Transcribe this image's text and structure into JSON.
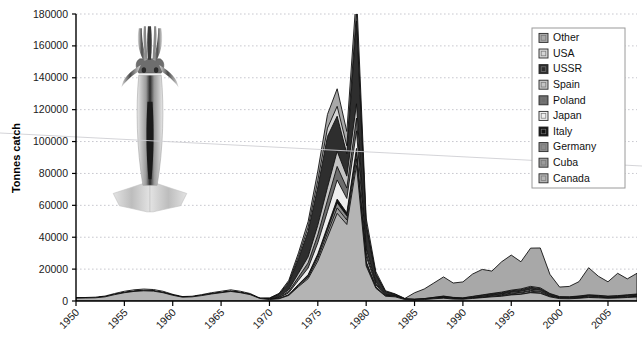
{
  "chart_data": {
    "type": "area",
    "title": "",
    "subtitle": "",
    "xlabel": "",
    "ylabel": "Tonnes catch",
    "stacked": true,
    "grid": true,
    "legend_position": "right-top",
    "xlim": [
      1950,
      2008
    ],
    "ylim": [
      0,
      180000
    ],
    "ytick_labels": [
      "0",
      "20000",
      "40000",
      "60000",
      "80000",
      "100000",
      "120000",
      "140000",
      "160000",
      "180000"
    ],
    "ytick_values": [
      0,
      20000,
      40000,
      60000,
      80000,
      100000,
      120000,
      140000,
      160000,
      180000
    ],
    "xtick_labels": [
      "1950",
      "1955",
      "1960",
      "1965",
      "1970",
      "1975",
      "1980",
      "1985",
      "1990",
      "1995",
      "2000",
      "2005"
    ],
    "xtick_values": [
      1950,
      1955,
      1960,
      1965,
      1970,
      1975,
      1980,
      1985,
      1990,
      1995,
      2000,
      2005
    ],
    "x": [
      1950,
      1951,
      1952,
      1953,
      1954,
      1955,
      1956,
      1957,
      1958,
      1959,
      1960,
      1961,
      1962,
      1963,
      1964,
      1965,
      1966,
      1967,
      1968,
      1969,
      1970,
      1971,
      1972,
      1973,
      1974,
      1975,
      1976,
      1977,
      1978,
      1979,
      1980,
      1981,
      1982,
      1983,
      1984,
      1985,
      1986,
      1987,
      1988,
      1989,
      1990,
      1991,
      1992,
      1993,
      1994,
      1995,
      1996,
      1997,
      1998,
      1999,
      2000,
      2001,
      2002,
      2003,
      2004,
      2005,
      2006,
      2007,
      2008
    ],
    "series": [
      {
        "name": "Canada",
        "color": "#b4b4b4",
        "values": [
          1800,
          1900,
          2000,
          2600,
          4000,
          5200,
          6000,
          6400,
          6200,
          5200,
          3600,
          2400,
          2600,
          3400,
          4400,
          5200,
          6000,
          5200,
          4000,
          1600,
          900,
          1400,
          3500,
          9000,
          14000,
          25000,
          40000,
          55000,
          48000,
          85000,
          22000,
          8000,
          3000,
          2600,
          900,
          700,
          900,
          1400,
          1800,
          1200,
          1100,
          1600,
          2100,
          2600,
          3000,
          3800,
          4200,
          5200,
          4800,
          2600,
          1500,
          1400,
          1700,
          2200,
          2000,
          1700,
          1900,
          2200,
          2500
        ]
      },
      {
        "name": "Cuba",
        "color": "#9c9c9c",
        "values": [
          0,
          0,
          0,
          0,
          0,
          0,
          0,
          0,
          0,
          0,
          0,
          0,
          0,
          0,
          0,
          0,
          0,
          0,
          0,
          0,
          0,
          0,
          200,
          600,
          1000,
          1800,
          2600,
          3400,
          2800,
          4200,
          1100,
          400,
          150,
          100,
          0,
          0,
          0,
          0,
          0,
          0,
          0,
          0,
          0,
          0,
          0,
          0,
          0,
          0,
          0,
          0,
          0,
          0,
          0,
          0,
          0,
          0,
          0,
          0,
          0
        ]
      },
      {
        "name": "Germany",
        "color": "#8c8c8c",
        "values": [
          0,
          0,
          0,
          0,
          0,
          0,
          0,
          0,
          0,
          0,
          0,
          0,
          0,
          0,
          0,
          0,
          0,
          0,
          0,
          0,
          0,
          0,
          150,
          500,
          900,
          1600,
          2400,
          3200,
          2600,
          3800,
          1000,
          350,
          120,
          80,
          0,
          0,
          0,
          0,
          0,
          0,
          0,
          0,
          0,
          0,
          0,
          0,
          0,
          0,
          0,
          0,
          0,
          0,
          0,
          0,
          0,
          0,
          0,
          0,
          0
        ]
      },
      {
        "name": "Italy",
        "color": "#121212",
        "values": [
          0,
          0,
          0,
          0,
          0,
          0,
          0,
          0,
          0,
          0,
          0,
          0,
          0,
          0,
          0,
          0,
          0,
          0,
          0,
          0,
          0,
          0,
          100,
          300,
          600,
          1100,
          1700,
          2300,
          1900,
          2700,
          700,
          250,
          90,
          60,
          0,
          0,
          0,
          0,
          0,
          0,
          0,
          0,
          0,
          0,
          0,
          0,
          0,
          0,
          0,
          0,
          0,
          0,
          0,
          0,
          0,
          0,
          0,
          0,
          0
        ]
      },
      {
        "name": "Japan",
        "color": "#eeeeee",
        "values": [
          0,
          0,
          0,
          0,
          0,
          0,
          0,
          0,
          0,
          0,
          0,
          0,
          0,
          0,
          0,
          0,
          0,
          0,
          0,
          0,
          200,
          500,
          1200,
          2600,
          4200,
          7000,
          9500,
          12000,
          9000,
          11000,
          3200,
          1200,
          400,
          200,
          100,
          100,
          150,
          200,
          300,
          250,
          200,
          300,
          400,
          500,
          600,
          700,
          800,
          900,
          800,
          500,
          300,
          300,
          350,
          400,
          380,
          320,
          350,
          400,
          450
        ]
      },
      {
        "name": "Poland",
        "color": "#6e6e6e",
        "values": [
          0,
          0,
          0,
          0,
          0,
          0,
          0,
          0,
          0,
          0,
          0,
          0,
          0,
          0,
          0,
          0,
          0,
          0,
          0,
          0,
          0,
          300,
          900,
          2000,
          3200,
          5000,
          7000,
          8500,
          6500,
          8000,
          2200,
          800,
          260,
          140,
          60,
          60,
          80,
          120,
          180,
          150,
          120,
          180,
          240,
          300,
          360,
          420,
          480,
          560,
          500,
          300,
          180,
          180,
          200,
          240,
          220,
          190,
          210,
          240,
          270
        ]
      },
      {
        "name": "Spain",
        "color": "#c4c4c4",
        "values": [
          0,
          0,
          0,
          0,
          0,
          0,
          0,
          0,
          0,
          0,
          0,
          0,
          0,
          0,
          0,
          0,
          0,
          0,
          0,
          0,
          100,
          400,
          1100,
          2400,
          3800,
          6000,
          8000,
          9500,
          7500,
          9000,
          2600,
          900,
          300,
          160,
          80,
          80,
          110,
          160,
          240,
          200,
          160,
          240,
          320,
          400,
          480,
          560,
          640,
          740,
          660,
          400,
          240,
          240,
          280,
          320,
          300,
          260,
          280,
          320,
          360
        ]
      },
      {
        "name": "USSR",
        "color": "#2e2e2e",
        "values": [
          0,
          0,
          0,
          0,
          0,
          0,
          0,
          0,
          0,
          0,
          0,
          0,
          0,
          0,
          0,
          0,
          0,
          0,
          0,
          0,
          400,
          1500,
          4000,
          9000,
          16000,
          24000,
          32000,
          22000,
          14000,
          52000,
          14000,
          4500,
          1400,
          700,
          200,
          150,
          200,
          300,
          400,
          320,
          260,
          400,
          520,
          650,
          780,
          900,
          1000,
          1200,
          1000,
          600,
          350,
          350,
          400,
          480,
          440,
          380,
          420,
          480,
          540
        ]
      },
      {
        "name": "USA",
        "color": "#d6d6d6",
        "values": [
          0,
          0,
          0,
          0,
          0,
          0,
          0,
          0,
          0,
          0,
          0,
          0,
          0,
          0,
          0,
          0,
          0,
          0,
          0,
          0,
          100,
          300,
          800,
          1600,
          2600,
          4000,
          5200,
          6200,
          5000,
          5600,
          1600,
          600,
          200,
          100,
          60,
          60,
          80,
          120,
          180,
          150,
          120,
          180,
          240,
          300,
          360,
          420,
          480,
          560,
          500,
          300,
          180,
          180,
          200,
          240,
          220,
          190,
          210,
          240,
          270
        ]
      },
      {
        "name": "Other",
        "color": "#a8a8a8",
        "values": [
          300,
          300,
          400,
          500,
          700,
          900,
          1000,
          1100,
          1000,
          900,
          600,
          400,
          400,
          600,
          800,
          900,
          1000,
          900,
          700,
          300,
          200,
          400,
          1000,
          2200,
          3600,
          6000,
          8600,
          11000,
          9000,
          12000,
          3600,
          1400,
          500,
          300,
          200,
          4000,
          6000,
          9000,
          12000,
          9000,
          10000,
          14000,
          16000,
          14000,
          19000,
          22000,
          17000,
          24000,
          25000,
          12000,
          6000,
          6500,
          9000,
          17000,
          12000,
          9000,
          14000,
          10000,
          13000
        ]
      }
    ],
    "peak_annotation": {
      "year": 1979,
      "value": 180000
    },
    "illustration": "squid-illustration"
  },
  "legend": {
    "items": [
      {
        "label": "Other",
        "color": "#a8a8a8"
      },
      {
        "label": "USA",
        "color": "#d6d6d6"
      },
      {
        "label": "USSR",
        "color": "#2e2e2e"
      },
      {
        "label": "Spain",
        "color": "#c4c4c4"
      },
      {
        "label": "Poland",
        "color": "#6e6e6e"
      },
      {
        "label": "Japan",
        "color": "#eeeeee"
      },
      {
        "label": "Italy",
        "color": "#121212"
      },
      {
        "label": "Germany",
        "color": "#8c8c8c"
      },
      {
        "label": "Cuba",
        "color": "#9c9c9c"
      },
      {
        "label": "Canada",
        "color": "#b4b4b4"
      }
    ]
  },
  "colors": {
    "axis": "#000000",
    "grid": "#c8c8cf",
    "background": "#ffffff",
    "outline": "#111111"
  }
}
